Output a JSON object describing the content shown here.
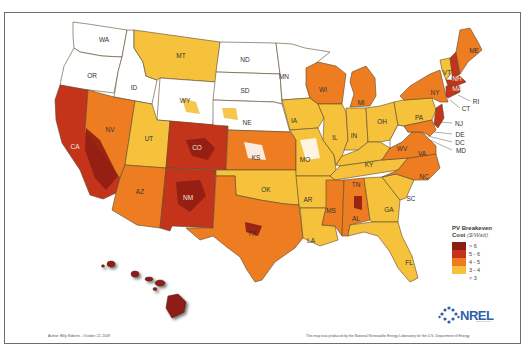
{
  "map": {
    "title": "PV Breakeven Cost map of the United States",
    "state_labels": {
      "WA": "WA",
      "OR": "OR",
      "CA": "CA",
      "ID": "ID",
      "NV": "NV",
      "MT": "MT",
      "WY": "WY",
      "UT": "UT",
      "AZ": "AZ",
      "CO": "CO",
      "NM": "NM",
      "ND": "ND",
      "SD": "SD",
      "NE": "NE",
      "KS": "KS",
      "OK": "OK",
      "TX": "TX",
      "MN": "MN",
      "IA": "IA",
      "MO": "MO",
      "AR": "AR",
      "LA": "LA",
      "WI": "WI",
      "IL": "IL",
      "MI": "MI",
      "IN": "IN",
      "OH": "OH",
      "KY": "KY",
      "TN": "TN",
      "MS": "MS",
      "AL": "AL",
      "GA": "GA",
      "FL": "FL",
      "SC": "SC",
      "NC": "NC",
      "VA": "VA",
      "WV": "WV",
      "PA": "PA",
      "NY": "NY",
      "VT": "VT",
      "NH": "NH",
      "ME": "ME",
      "MA": "MA",
      "RI": "RI",
      "CT": "CT",
      "NJ": "NJ",
      "DE": "DE",
      "DC": "DC",
      "MD": "MD"
    },
    "callouts": [
      "RI",
      "CT",
      "NJ",
      "DE",
      "DC",
      "MD"
    ]
  },
  "legend": {
    "title": "PV Breakeven",
    "subtitle": "Cost",
    "unit": "($/Watt)",
    "items": [
      {
        "label": "> 6",
        "color": "#8f1d12"
      },
      {
        "label": "5 - 6",
        "color": "#c3341a"
      },
      {
        "label": "4 - 5",
        "color": "#ee7d22"
      },
      {
        "label": "3 - 4",
        "color": "#f6c23b"
      },
      {
        "label": "< 3",
        "color": "#ffffff"
      }
    ]
  },
  "logo": {
    "name": "NREL",
    "subtitle": "www.nrel.gov"
  },
  "footer": {
    "author": "Author: Billy Roberts - October 22, 2009",
    "credit": "This map was produced by the National Renewable Energy Laboratory for the U.S. Department of Energy"
  },
  "colors": {
    "gt6": "#8f1d12",
    "c5_6": "#c3341a",
    "c4_5": "#ee7d22",
    "c3_4": "#f6c23b",
    "lt3": "#ffffff",
    "border": "#5a4a2a",
    "nrel_blue": "#2f5fa8"
  }
}
